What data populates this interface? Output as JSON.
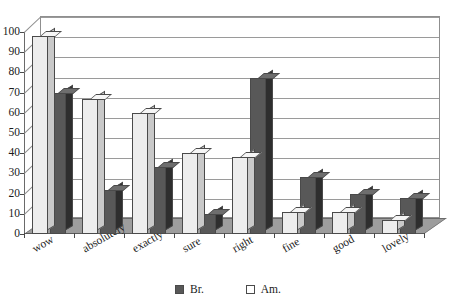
{
  "chart_data": {
    "type": "bar",
    "title": "",
    "xlabel": "",
    "ylabel": "",
    "categories": [
      "wow",
      "absolutely",
      "exactly",
      "sure",
      "right",
      "fine",
      "good",
      "lovely"
    ],
    "series": [
      {
        "name": "Br.",
        "color": "#585858",
        "values": [
          70,
          22,
          33,
          10,
          77,
          28,
          20,
          18
        ]
      },
      {
        "name": "Am.",
        "color": "#ededed",
        "values": [
          98,
          67,
          60,
          40,
          38,
          11,
          11,
          7
        ]
      }
    ],
    "series_order_in_group": [
      "Am.",
      "Br."
    ],
    "ylim": [
      0,
      100
    ],
    "ytick_labels": [
      "0",
      "10",
      "20",
      "30",
      "40",
      "50",
      "60",
      "70",
      "80",
      "90",
      "100"
    ],
    "ytick_values": [
      0,
      10,
      20,
      30,
      40,
      50,
      60,
      70,
      80,
      90,
      100
    ],
    "grid": true,
    "legend_position": "bottom",
    "style": "3d-column"
  },
  "legend": {
    "items": [
      {
        "label": "Br.",
        "swatch": "dark-gray"
      },
      {
        "label": "Am.",
        "swatch": "white"
      }
    ]
  }
}
